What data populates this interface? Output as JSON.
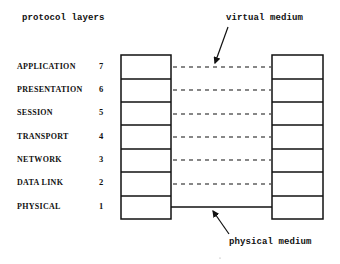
{
  "title": "protocol layers",
  "annotations": {
    "virtual_medium": "virtual medium",
    "physical_medium": "physical medium"
  },
  "layers": [
    {
      "name": "APPLICATION",
      "number": "7"
    },
    {
      "name": "PRESENTATION",
      "number": "6"
    },
    {
      "name": "SESSION",
      "number": "5"
    },
    {
      "name": "TRANSPORT",
      "number": "4"
    },
    {
      "name": "NETWORK",
      "number": "3"
    },
    {
      "name": "DATA LINK",
      "number": "2"
    },
    {
      "name": "PHYSICAL",
      "number": "1"
    }
  ],
  "colors": {
    "line": "#111111",
    "background": "#ffffff"
  }
}
